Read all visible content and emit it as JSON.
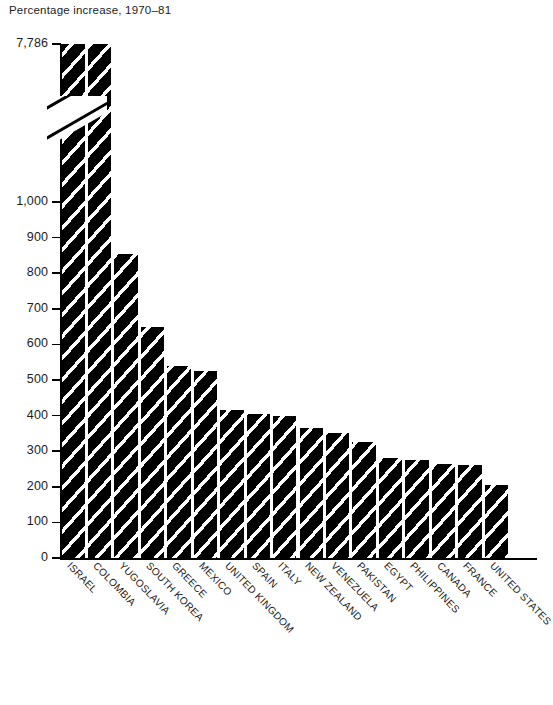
{
  "chart_data": {
    "type": "bar",
    "title": "Percentage increase, 1970–81",
    "xlabel": "",
    "ylabel": "",
    "grid": false,
    "legend": "none",
    "axis_break": true,
    "axis_break_note": "y-axis broken between 1,000 and 7,786",
    "ylim": [
      0,
      1000
    ],
    "ytick_labels": [
      "7,786",
      "1,000",
      "900",
      "800",
      "700",
      "600",
      "500",
      "400",
      "300",
      "200",
      "100",
      "0"
    ],
    "yticks": [
      7786,
      1000,
      900,
      800,
      700,
      600,
      500,
      400,
      300,
      200,
      100,
      0
    ],
    "categories": [
      "ISRAEL",
      "COLOMBIA",
      "YUGOSLAVIA",
      "SOUTH KOREA",
      "GREECE",
      "MEXICO",
      "UNITED KINGDOM",
      "SPAIN",
      "ITALY",
      "NEW ZEALAND",
      "VENEZUELA",
      "PAKISTAN",
      "EGYPT",
      "PHILIPPINES",
      "CANADA",
      "FRANCE",
      "UNITED STATES"
    ],
    "values": [
      7786,
      1060,
      855,
      650,
      540,
      525,
      415,
      405,
      400,
      365,
      350,
      325,
      280,
      275,
      265,
      260,
      205
    ],
    "series": [
      {
        "name": "Percentage increase, 1970-81",
        "values": [
          7786,
          1060,
          855,
          650,
          540,
          525,
          415,
          405,
          400,
          365,
          350,
          325,
          280,
          275,
          265,
          260,
          205
        ]
      }
    ]
  }
}
